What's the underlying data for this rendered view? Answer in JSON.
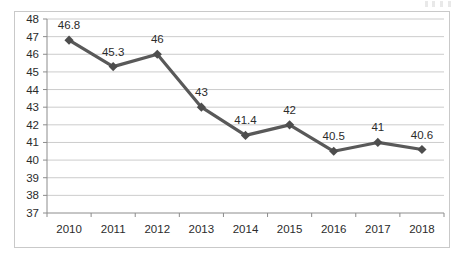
{
  "chart_data": {
    "type": "line",
    "title": "",
    "subtitle": "",
    "xlabel": "",
    "ylabel": "",
    "categories": [
      "2010",
      "2011",
      "2012",
      "2013",
      "2014",
      "2015",
      "2016",
      "2017",
      "2018"
    ],
    "values": [
      46.8,
      45.3,
      46,
      43,
      41.4,
      42,
      40.5,
      41,
      40.6
    ],
    "point_labels": [
      "46.8",
      "45.3",
      "46",
      "43",
      "41.4",
      "42",
      "40.5",
      "41",
      "40.6"
    ],
    "ylim": [
      37,
      48
    ],
    "ytick_labels": [
      "48",
      "47",
      "46",
      "45",
      "44",
      "43",
      "42",
      "41",
      "40",
      "39",
      "38",
      "37"
    ],
    "ytick_values": [
      48,
      47,
      46,
      45,
      44,
      43,
      42,
      41,
      40,
      39,
      38,
      37
    ],
    "ystep": 1,
    "grid": "horizontal",
    "legend": "none",
    "series": [
      {
        "name": "",
        "values": [
          46.8,
          45.3,
          46,
          43,
          41.4,
          42,
          40.5,
          41,
          40.6
        ],
        "line_color": "#595959",
        "marker_color": "#4d4d4d",
        "marker": "diamond"
      }
    ],
    "colors": {
      "line": "#595959",
      "marker": "#4d4d4d",
      "gridline": "#bfbfbf",
      "axis": "#8c8c8c",
      "text": "#2b2b2b",
      "frame": "#c9c9c9",
      "background": "#ffffff"
    }
  }
}
